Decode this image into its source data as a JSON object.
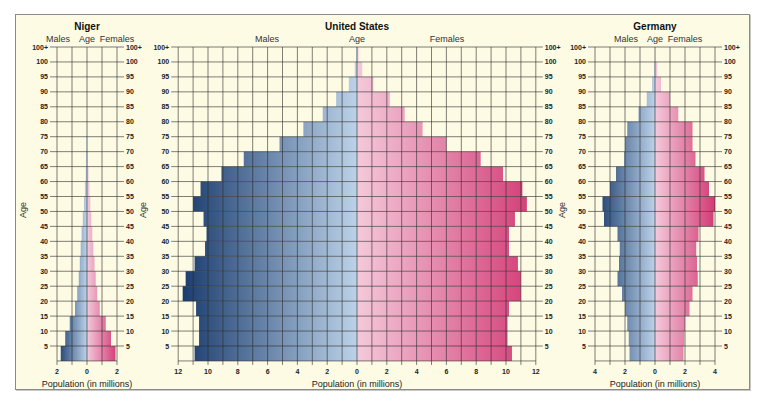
{
  "figure": {
    "background": "#fdfbe4",
    "male_color_outer": "#17396b",
    "male_color_inner": "#bcd2e8",
    "female_color_inner": "#f4c9da",
    "female_color_outer": "#d23a74",
    "age_axis_label": "Age"
  },
  "chart_data": [
    {
      "type": "bar",
      "subtype": "population-pyramid",
      "title": "Niger",
      "header_left": "Males",
      "header_center": "Age",
      "header_right": "Females",
      "xlabel": "Population (in millions)",
      "ylabel": "Age",
      "xlim": [
        -2,
        2
      ],
      "x_tick_labels": [
        "2",
        "0",
        "2"
      ],
      "grid_step": 1,
      "age_tick_labels": [
        "100+",
        "100",
        "95",
        "90",
        "85",
        "80",
        "75",
        "70",
        "65",
        "60",
        "55",
        "50",
        "45",
        "40",
        "35",
        "30",
        "25",
        "20",
        "15",
        "10",
        "5"
      ],
      "categories": [
        "0-4",
        "5-9",
        "10-14",
        "15-19",
        "20-24",
        "25-29",
        "30-34",
        "35-39",
        "40-44",
        "45-49",
        "50-54",
        "55-59",
        "60-64",
        "65-69",
        "70-74",
        "75-79",
        "80-84",
        "85-89",
        "90-94",
        "95-99",
        "100+"
      ],
      "series": [
        {
          "name": "Males",
          "values": [
            1.75,
            1.45,
            1.15,
            0.8,
            0.65,
            0.55,
            0.48,
            0.42,
            0.36,
            0.28,
            0.2,
            0.14,
            0.08,
            0.05,
            0.03,
            0.01,
            0,
            0,
            0,
            0,
            0
          ]
        },
        {
          "name": "Females",
          "values": [
            1.9,
            1.6,
            1.25,
            0.85,
            0.68,
            0.58,
            0.5,
            0.42,
            0.35,
            0.28,
            0.22,
            0.16,
            0.1,
            0.05,
            0.03,
            0.01,
            0,
            0,
            0,
            0,
            0
          ]
        }
      ]
    },
    {
      "type": "bar",
      "subtype": "population-pyramid",
      "title": "United States",
      "header_left": "Males",
      "header_center": "Age",
      "header_right": "Females",
      "xlabel": "Population (in millions)",
      "ylabel": "Age",
      "xlim": [
        -12,
        12
      ],
      "x_tick_labels": [
        "12",
        "10",
        "8",
        "6",
        "4",
        "2",
        "0",
        "2",
        "4",
        "6",
        "8",
        "10",
        "12"
      ],
      "grid_step": 1,
      "age_tick_labels": [
        "100+",
        "100",
        "95",
        "90",
        "85",
        "80",
        "75",
        "70",
        "65",
        "60",
        "55",
        "50",
        "45",
        "40",
        "35",
        "30",
        "25",
        "20",
        "15",
        "10",
        "5"
      ],
      "categories": [
        "0-4",
        "5-9",
        "10-14",
        "15-19",
        "20-24",
        "25-29",
        "30-34",
        "35-39",
        "40-44",
        "45-49",
        "50-54",
        "55-59",
        "60-64",
        "65-69",
        "70-74",
        "75-79",
        "80-84",
        "85-89",
        "90-94",
        "95-99",
        "100+"
      ],
      "series": [
        {
          "name": "Males",
          "values": [
            10.9,
            10.6,
            10.6,
            10.8,
            11.7,
            11.5,
            10.9,
            10.2,
            10.1,
            10.3,
            11.0,
            10.5,
            9.1,
            7.6,
            5.2,
            3.6,
            2.3,
            1.4,
            0.55,
            0.15,
            0.05
          ]
        },
        {
          "name": "Females",
          "values": [
            10.4,
            10.1,
            10.1,
            10.2,
            11.0,
            11.0,
            10.8,
            10.2,
            10.2,
            10.6,
            11.4,
            11.1,
            9.8,
            8.3,
            6.0,
            4.4,
            3.2,
            2.2,
            1.1,
            0.35,
            0.1
          ]
        }
      ]
    },
    {
      "type": "bar",
      "subtype": "population-pyramid",
      "title": "Germany",
      "header_left": "Males",
      "header_center": "Age",
      "header_right": "Females",
      "xlabel": "Population (in millions)",
      "ylabel": "Age",
      "xlim": [
        -4,
        4
      ],
      "x_tick_labels": [
        "4",
        "2",
        "0",
        "2",
        "4"
      ],
      "grid_step": 1,
      "age_tick_labels": [
        "100+",
        "100",
        "95",
        "90",
        "85",
        "80",
        "75",
        "70",
        "65",
        "60",
        "55",
        "50",
        "45",
        "40",
        "35",
        "30",
        "25",
        "20",
        "15",
        "10",
        "5"
      ],
      "categories": [
        "0-4",
        "5-9",
        "10-14",
        "15-19",
        "20-24",
        "25-29",
        "30-34",
        "35-39",
        "40-44",
        "45-49",
        "50-54",
        "55-59",
        "60-64",
        "65-69",
        "70-74",
        "75-79",
        "80-84",
        "85-89",
        "90-94",
        "95-99",
        "100+"
      ],
      "series": [
        {
          "name": "Males",
          "values": [
            1.7,
            1.75,
            1.85,
            2.0,
            2.2,
            2.5,
            2.4,
            2.35,
            2.5,
            3.4,
            3.5,
            3.0,
            2.6,
            2.05,
            2.0,
            1.85,
            1.1,
            0.55,
            0.2,
            0.05,
            0
          ]
        },
        {
          "name": "Females",
          "values": [
            1.9,
            1.95,
            2.0,
            2.3,
            2.5,
            2.85,
            2.8,
            2.75,
            2.9,
            3.9,
            4.0,
            3.6,
            3.3,
            2.7,
            2.5,
            2.5,
            1.55,
            1.0,
            0.4,
            0.15,
            0.02
          ]
        }
      ]
    }
  ]
}
